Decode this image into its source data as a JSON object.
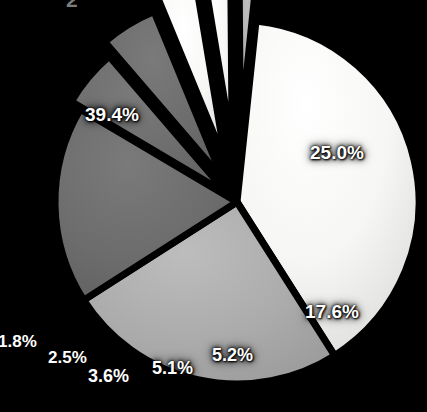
{
  "page": {
    "background_color": "#000000",
    "page_number": "2"
  },
  "chart_data": {
    "type": "pie",
    "title": "",
    "subtitle": "",
    "xlabel": "",
    "ylabel": "",
    "grid": false,
    "legend_position": "none",
    "label_format": "percent-one-decimal",
    "center": {
      "x": 237,
      "y": 202
    },
    "radius": 182,
    "start_angle_deg": -84,
    "direction": "clockwise",
    "separator_color": "#000000",
    "separator_width_px": 7,
    "label_text_color": "#ffffff",
    "categories": [
      "Segment 1",
      "Segment 2",
      "Segment 3",
      "Segment 4",
      "Segment 5",
      "Segment 6",
      "Segment 7",
      "Segment 8"
    ],
    "values": [
      39.4,
      25.0,
      17.6,
      5.2,
      5.1,
      3.6,
      2.5,
      1.8
    ],
    "slices": [
      {
        "label": "39.4%",
        "value": 39.4,
        "color": "#f4f4f2",
        "exploded": false,
        "explode_offset": 0,
        "label_x": 85,
        "label_y": 104,
        "label_size": "lbl-big"
      },
      {
        "label": "25.0%",
        "value": 25.0,
        "color": "#acacac",
        "exploded": false,
        "explode_offset": 0,
        "label_x": 310,
        "label_y": 142,
        "label_size": "lbl-big"
      },
      {
        "label": "17.6%",
        "value": 17.6,
        "color": "#6e6e6e",
        "exploded": false,
        "explode_offset": 0,
        "label_x": 305,
        "label_y": 301,
        "label_size": "lbl-big"
      },
      {
        "label": "5.2%",
        "value": 5.2,
        "color": "#5e5e5e",
        "exploded": true,
        "explode_offset": 12,
        "label_x": 212,
        "label_y": 345,
        "label_size": "lbl-mid"
      },
      {
        "label": "5.1%",
        "value": 5.1,
        "color": "#787878",
        "exploded": true,
        "explode_offset": 26,
        "label_x": 152,
        "label_y": 358,
        "label_size": "lbl-mid"
      },
      {
        "label": "3.6%",
        "value": 3.6,
        "color": "#ededeb",
        "exploded": true,
        "explode_offset": 40,
        "label_x": 88,
        "label_y": 366,
        "label_size": "lbl-mid"
      },
      {
        "label": "2.5%",
        "value": 2.5,
        "color": "#c9c9c9",
        "exploded": true,
        "explode_offset": 56,
        "label_x": 48,
        "label_y": 348,
        "label_size": "lbl-small"
      },
      {
        "label": "1.8%",
        "value": 1.8,
        "color": "#a6a6a6",
        "exploded": true,
        "explode_offset": 70,
        "label_x": -2,
        "label_y": 332,
        "label_size": "lbl-small"
      }
    ]
  }
}
